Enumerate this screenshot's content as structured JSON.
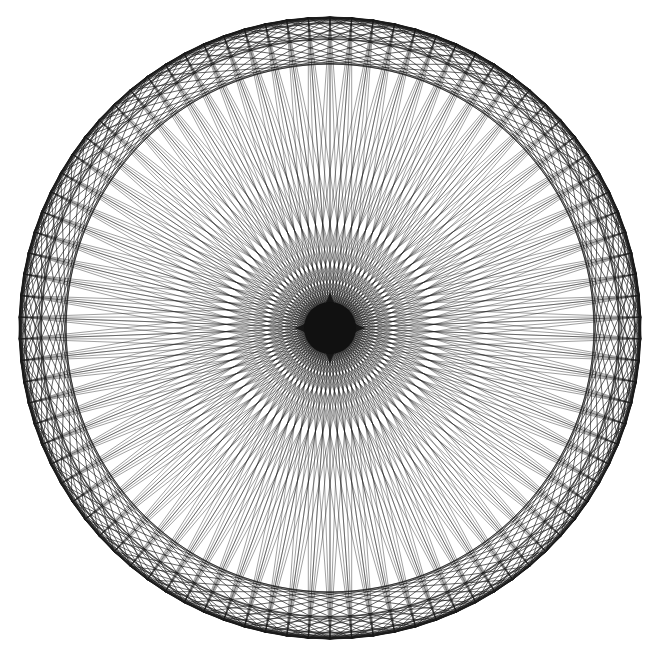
{
  "figure": {
    "kind": "string-art circle chord pattern",
    "background": "#ffffff",
    "stroke_color": "#1a1a1a",
    "center": [
      330,
      328
    ],
    "radius": 311,
    "point_count": 90,
    "rotation_deg": -90,
    "chord_groups": [
      {
        "name": "outer-zigzag-1",
        "offset": 1,
        "stroke_width": 1.0,
        "opacity": 0.85
      },
      {
        "name": "outer-zigzag-2",
        "offset": 2,
        "stroke_width": 1.0,
        "opacity": 0.85
      },
      {
        "name": "outer-zigzag-3",
        "offset": 3,
        "stroke_width": 1.0,
        "opacity": 0.8
      },
      {
        "name": "outer-band-4",
        "offset": 4,
        "stroke_width": 0.9,
        "opacity": 0.75
      },
      {
        "name": "outer-band-6",
        "offset": 6,
        "stroke_width": 0.9,
        "opacity": 0.7
      },
      {
        "name": "inner-ring-11",
        "offset": 11,
        "stroke_width": 0.9,
        "opacity": 0.7
      },
      {
        "name": "inner-ring-16",
        "offset": 16,
        "stroke_width": 0.9,
        "opacity": 0.75
      },
      {
        "name": "near-diameter-a",
        "offset": 43,
        "stroke_width": 0.7,
        "opacity": 0.6
      },
      {
        "name": "near-diameter-b",
        "offset": 44,
        "stroke_width": 0.7,
        "opacity": 0.6
      },
      {
        "name": "diameter",
        "offset": 45,
        "stroke_width": 0.7,
        "opacity": 0.6
      }
    ],
    "center_blot": {
      "rx": 30,
      "ry": 30,
      "color": "#111111"
    }
  }
}
